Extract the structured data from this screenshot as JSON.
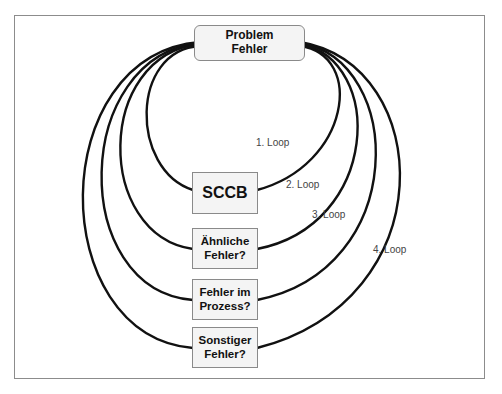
{
  "diagram": {
    "top_node": {
      "label": "Problem\nFehler"
    },
    "nodes": [
      {
        "label": "SCCB"
      },
      {
        "label": "Ähnliche\nFehler?"
      },
      {
        "label": "Fehler im\nProzess?"
      },
      {
        "label": "Sonstiger\nFehler?"
      }
    ],
    "loops": [
      {
        "label": "1. Loop",
        "connects": [
          "Problem Fehler",
          "SCCB"
        ]
      },
      {
        "label": "2. Loop",
        "connects": [
          "Problem Fehler",
          "Ähnliche Fehler?"
        ]
      },
      {
        "label": "3. Loop",
        "connects": [
          "Problem Fehler",
          "Fehler im Prozess?"
        ]
      },
      {
        "label": "4. Loop",
        "connects": [
          "Problem Fehler",
          "Sonstiger Fehler?"
        ]
      }
    ],
    "colors": {
      "line": "#111111",
      "box_border": "#8a8a8a",
      "box_fill": "#f4f4f4",
      "frame": "#8c8c8c",
      "label": "#444444"
    }
  }
}
